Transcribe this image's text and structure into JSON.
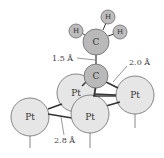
{
  "diagram": {
    "colors": {
      "carbon": "#b9b9b9",
      "hydrogen": "#bdbdbd",
      "platinum": "#e6e6e6",
      "stroke": "#6a6a6a",
      "bond": "#333333"
    },
    "atoms": {
      "h1": {
        "label": "H"
      },
      "h2": {
        "label": "H"
      },
      "h3": {
        "label": "H"
      },
      "c_top": {
        "label": "C"
      },
      "c_bottom": {
        "label": "C"
      },
      "pt_back": {
        "label": "Pt"
      },
      "pt_right": {
        "label": "Pt"
      },
      "pt_left": {
        "label": "Pt"
      },
      "pt_front": {
        "label": "Pt"
      }
    },
    "dimensions": {
      "cc_bond": "1.5 Å",
      "c_pt_bond": "2.0 Å",
      "pt_pt_distance": "2.8 Å"
    }
  }
}
